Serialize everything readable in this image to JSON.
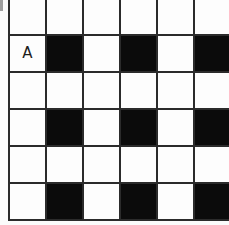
{
  "diagram": {
    "type": "checkerboard-grid",
    "colors": {
      "filled": "#0b0b0b",
      "empty": "#fdfdfd",
      "gridline": "#2b2b2b",
      "background": "#fbfbfb",
      "label_text": "#1d1d1d"
    },
    "geometry": {
      "columns": 6,
      "rows_visible": 6,
      "cell_size_px": 37,
      "gridline_width_px": 2,
      "bottom_row_cropped": true,
      "right_edge_cropped": true
    },
    "artifacts": {
      "corner_speck": "scan-speck"
    },
    "legend": {
      "filled_meaning": "black square",
      "empty_meaning": "white square"
    },
    "rows": [
      {
        "index": 0,
        "cells": [
          {
            "filled": false,
            "label": ""
          },
          {
            "filled": false,
            "label": ""
          },
          {
            "filled": false,
            "label": ""
          },
          {
            "filled": false,
            "label": ""
          },
          {
            "filled": false,
            "label": ""
          },
          {
            "filled": false,
            "label": ""
          }
        ]
      },
      {
        "index": 1,
        "cells": [
          {
            "filled": false,
            "label": "A"
          },
          {
            "filled": true,
            "label": ""
          },
          {
            "filled": false,
            "label": ""
          },
          {
            "filled": true,
            "label": ""
          },
          {
            "filled": false,
            "label": ""
          },
          {
            "filled": true,
            "label": ""
          }
        ]
      },
      {
        "index": 2,
        "cells": [
          {
            "filled": false,
            "label": ""
          },
          {
            "filled": false,
            "label": ""
          },
          {
            "filled": false,
            "label": ""
          },
          {
            "filled": false,
            "label": ""
          },
          {
            "filled": false,
            "label": ""
          },
          {
            "filled": false,
            "label": ""
          }
        ]
      },
      {
        "index": 3,
        "cells": [
          {
            "filled": false,
            "label": ""
          },
          {
            "filled": true,
            "label": ""
          },
          {
            "filled": false,
            "label": ""
          },
          {
            "filled": true,
            "label": ""
          },
          {
            "filled": false,
            "label": ""
          },
          {
            "filled": true,
            "label": ""
          }
        ]
      },
      {
        "index": 4,
        "cells": [
          {
            "filled": false,
            "label": ""
          },
          {
            "filled": false,
            "label": ""
          },
          {
            "filled": false,
            "label": ""
          },
          {
            "filled": false,
            "label": ""
          },
          {
            "filled": false,
            "label": ""
          },
          {
            "filled": false,
            "label": ""
          }
        ]
      },
      {
        "index": 5,
        "cells": [
          {
            "filled": false,
            "label": ""
          },
          {
            "filled": true,
            "label": ""
          },
          {
            "filled": false,
            "label": ""
          },
          {
            "filled": true,
            "label": ""
          },
          {
            "filled": false,
            "label": ""
          },
          {
            "filled": true,
            "label": ""
          }
        ]
      }
    ]
  }
}
